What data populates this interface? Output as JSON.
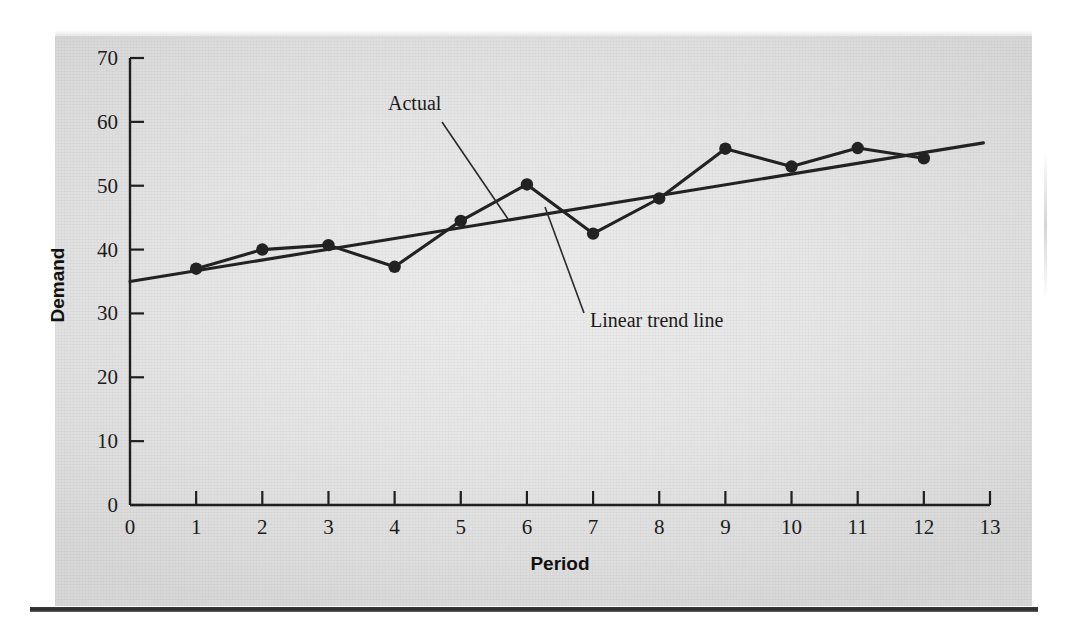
{
  "figure": {
    "background_color": "#e6e6e6",
    "ink_color": "#1b1b1b",
    "panel": {
      "x": 55,
      "y": 36,
      "width": 977,
      "height": 570
    }
  },
  "chart_data": {
    "type": "line",
    "title": "",
    "xlabel": "Period",
    "ylabel": "Demand",
    "xlim": [
      0,
      13
    ],
    "ylim": [
      0,
      70
    ],
    "xticks": [
      0,
      1,
      2,
      3,
      4,
      5,
      6,
      7,
      8,
      9,
      10,
      11,
      12,
      13
    ],
    "xtick_labels": [
      "0",
      "1",
      "2",
      "3",
      "4",
      "5",
      "6",
      "7",
      "8",
      "9",
      "10",
      "11",
      "12",
      "13"
    ],
    "yticks": [
      0,
      10,
      20,
      30,
      40,
      50,
      60,
      70
    ],
    "ytick_labels": [
      "0",
      "10",
      "20",
      "30",
      "40",
      "50",
      "60",
      "70"
    ],
    "grid": false,
    "legend": "none",
    "x": [
      1,
      2,
      3,
      4,
      5,
      6,
      7,
      8,
      9,
      10,
      11,
      12
    ],
    "series": [
      {
        "name": "Actual",
        "type": "line-markers",
        "marker": "circle",
        "color": "#222222",
        "values": [
          37.0,
          40.0,
          40.7,
          37.3,
          44.5,
          50.2,
          42.5,
          48.0,
          55.8,
          53.0,
          55.9,
          54.3
        ]
      },
      {
        "name": "Linear trend line",
        "type": "line",
        "marker": "none",
        "color": "#222222",
        "endpoints": [
          {
            "x": 0.0,
            "y": 35.0
          },
          {
            "x": 12.9,
            "y": 56.7
          }
        ]
      }
    ],
    "annotations": [
      {
        "label": "Actual",
        "text_x": 388,
        "text_y": 110,
        "leader_from": [
          442,
          122
        ],
        "leader_to": [
          508,
          219
        ]
      },
      {
        "label": "Linear trend line",
        "text_x": 590,
        "text_y": 327,
        "leader_from": [
          584,
          313
        ],
        "leader_to": [
          545,
          207
        ]
      }
    ]
  }
}
